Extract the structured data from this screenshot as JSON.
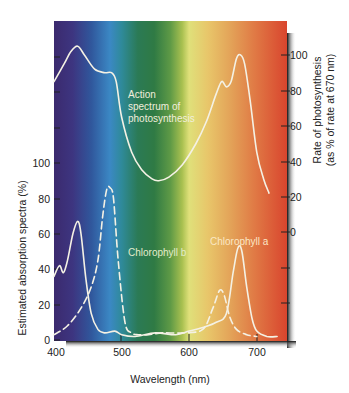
{
  "chart_data": {
    "type": "line",
    "title": "",
    "xlabel": "Wavelength (nm)",
    "ylabel": "Estimated absorption spectra (%)",
    "ylabel_right": "Rate of photosynthesis (as % of rate at 670 nm)",
    "xlim": [
      400,
      740
    ],
    "ylim": [
      0,
      100
    ],
    "ylim_right": [
      0,
      100
    ],
    "x_ticks": [
      400,
      500,
      600,
      700
    ],
    "y_ticks_left": [
      0,
      20,
      40,
      60,
      80,
      100
    ],
    "y_ticks_right": [
      0,
      20,
      40,
      60,
      80,
      100
    ],
    "background": "visible light spectrum gradient (violet → blue → green → yellow → orange → red)",
    "grid": false,
    "legend": "inline annotations",
    "annotations": [
      {
        "text": "Action spectrum of photosynthesis",
        "near_x": 520
      },
      {
        "text": "Chlorophyll b",
        "near_x": 540
      },
      {
        "text": "Chlorophyll a",
        "near_x": 670
      }
    ],
    "series": [
      {
        "name": "Action spectrum of photosynthesis",
        "axis": "right",
        "style": "solid",
        "x": [
          400,
          415,
          425,
          435,
          445,
          460,
          475,
          485,
          492,
          500,
          515,
          530,
          545,
          555,
          570,
          590,
          610,
          625,
          640,
          648,
          655,
          662,
          670,
          676,
          682,
          690,
          700,
          710,
          718
        ],
        "values": [
          85,
          95,
          102,
          105,
          100,
          92,
          90,
          90,
          85,
          65,
          45,
          35,
          30,
          29,
          31,
          38,
          50,
          62,
          78,
          85,
          82,
          85,
          98,
          100,
          95,
          75,
          45,
          30,
          22
        ]
      },
      {
        "name": "Chlorophyll a",
        "axis": "left",
        "style": "solid",
        "x": [
          400,
          408,
          414,
          420,
          428,
          435,
          440,
          447,
          455,
          465,
          475,
          490,
          500,
          520,
          550,
          580,
          600,
          620,
          640,
          655,
          665,
          672,
          678,
          685,
          693,
          700,
          715,
          730
        ],
        "values": [
          36,
          42,
          38,
          45,
          60,
          67,
          60,
          35,
          15,
          6,
          4,
          5,
          3,
          2,
          4,
          3,
          5,
          7,
          10,
          15,
          38,
          52,
          50,
          30,
          12,
          5,
          2,
          2
        ]
      },
      {
        "name": "Chlorophyll b",
        "axis": "left",
        "style": "dashed",
        "x": [
          400,
          420,
          440,
          455,
          465,
          472,
          478,
          483,
          488,
          495,
          505,
          515,
          525,
          540,
          560,
          590,
          620,
          635,
          645,
          652,
          660,
          670,
          685,
          700
        ],
        "values": [
          3,
          8,
          18,
          30,
          45,
          70,
          85,
          86,
          80,
          45,
          10,
          4,
          3,
          3,
          4,
          4,
          6,
          18,
          28,
          25,
          13,
          6,
          3,
          2
        ]
      }
    ]
  },
  "labels": {
    "xlabel": "Wavelength (nm)",
    "ylabel_left": "Estimated absorption spectra (%)",
    "ylabel_right_line1": "Rate of photosynthesis",
    "ylabel_right_line2": "(as % of rate at 670 nm)",
    "action_line1": "Action",
    "action_line2": "spectrum of",
    "action_line3": "photosynthesis",
    "chl_b": "Chlorophyll b",
    "chl_a": "Chlorophyll a",
    "x_ticks": [
      "400",
      "500",
      "600",
      "700"
    ],
    "y_left_ticks": [
      "0",
      "20",
      "40",
      "60",
      "80",
      "100"
    ],
    "y_right_ticks": [
      "0",
      "20",
      "40",
      "60",
      "80",
      "100"
    ]
  },
  "colors": {
    "curve": "#f4f1e4",
    "tick": "#222222",
    "shadow": "#1a1a1a"
  }
}
